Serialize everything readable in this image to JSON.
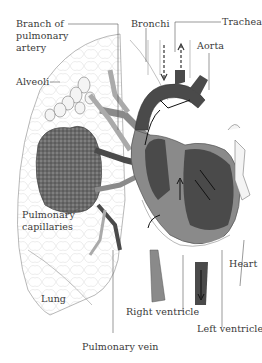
{
  "figure": {
    "labels": {
      "branch_of_pulmonary_artery_line1": "Branch of",
      "branch_of_pulmonary_artery_line2": "pulmonary",
      "branch_of_pulmonary_artery_line3": "artery",
      "bronchi": "Bronchi",
      "trachea": "Trachea",
      "aorta": "Aorta",
      "alveoli": "Alveoli",
      "pulmonary_capillaries_line1": "Pulmonary",
      "pulmonary_capillaries_line2": "capillaries",
      "heart": "Heart",
      "lung": "Lung",
      "right_ventricle": "Right ventricle",
      "left_ventricle": "Left ventricle",
      "pulmonary_vein": "Pulmonary vein"
    },
    "colors": {
      "dark_vessel": "#4a4a4a",
      "medium_vessel": "#8a8a8a",
      "light_vessel": "#b5b5b5",
      "outline": "#777777",
      "label_text": "#3a3a3a"
    }
  }
}
